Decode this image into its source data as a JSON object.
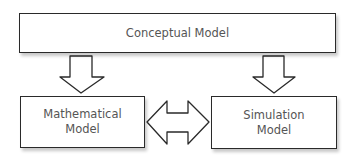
{
  "diagram": {
    "nodes": [
      {
        "id": "conceptual",
        "label": "Conceptual Model",
        "lines": [
          "Conceptual Model"
        ]
      },
      {
        "id": "mathematical",
        "label": "Mathematical Model",
        "lines": [
          "Mathematical",
          "Model"
        ]
      },
      {
        "id": "simulation",
        "label": "Simulation Model",
        "lines": [
          "Simulation",
          "Model"
        ]
      }
    ],
    "edges": [
      {
        "from": "conceptual",
        "to": "mathematical",
        "type": "down-arrow"
      },
      {
        "from": "conceptual",
        "to": "simulation",
        "type": "down-arrow"
      },
      {
        "from": "mathematical",
        "to": "simulation",
        "type": "bidirectional-arrow"
      }
    ],
    "colors": {
      "stroke": "#2a2a2a",
      "text": "#555555",
      "fill": "#ffffff"
    }
  }
}
